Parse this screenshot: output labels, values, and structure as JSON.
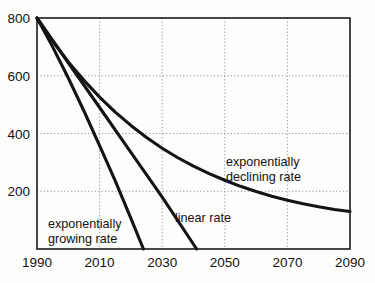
{
  "chart_data": {
    "type": "line",
    "title": "",
    "subtitle": "",
    "xlabel": "",
    "ylabel": "",
    "xlim": [
      1990,
      2090
    ],
    "ylim": [
      0,
      800
    ],
    "grid": true,
    "legend_position": "inline-annotations",
    "x_ticks": [
      1990,
      2010,
      2030,
      2050,
      2070,
      2090
    ],
    "x_tick_labels": [
      "1990",
      "2010",
      "2030",
      "2050",
      "2070",
      "2090"
    ],
    "y_ticks": [
      200,
      400,
      600,
      800
    ],
    "y_tick_labels": [
      "200",
      "400",
      "600",
      "800"
    ],
    "series": [
      {
        "name": "exponentially declining rate",
        "label": "exponentially declining rate",
        "label_line1": "exponentially",
        "label_line2": "declining rate",
        "x": [
          1990,
          1995,
          2000,
          2005,
          2010,
          2015,
          2020,
          2025,
          2030,
          2035,
          2040,
          2045,
          2050,
          2055,
          2060,
          2065,
          2070,
          2075,
          2080,
          2085,
          2090
        ],
        "values": [
          800,
          720,
          648,
          584,
          526,
          474,
          428,
          386,
          349,
          316,
          287,
          261,
          238,
          217,
          199,
          183,
          169,
          157,
          146,
          137,
          130
        ]
      },
      {
        "name": "linear rate",
        "label": "linear rate",
        "label_line1": "linear rate",
        "label_line2": "",
        "x": [
          1990,
          2000,
          2010,
          2020,
          2030,
          2041
        ],
        "values": [
          800,
          645,
          490,
          335,
          180,
          0
        ]
      },
      {
        "name": "exponentially growing rate",
        "label": "exponentially growing rate",
        "label_line1": "exponentially",
        "label_line2": "growing rate",
        "x": [
          1990,
          1995,
          2000,
          2005,
          2010,
          2015,
          2020,
          2024
        ],
        "values": [
          800,
          700,
          592,
          478,
          358,
          236,
          106,
          0
        ]
      }
    ],
    "annotations": [
      {
        "name": "exponentially-declining-rate-label",
        "line1": "exponentially",
        "line2": "declining rate",
        "x": 226,
        "y": 166
      },
      {
        "name": "linear-rate-label",
        "line1": "linear rate",
        "line2": "",
        "x": 175,
        "y": 222
      },
      {
        "name": "exponentially-growing-rate-label",
        "line1": "exponentially",
        "line2": "growing rate",
        "x": 48,
        "y": 228
      }
    ],
    "colors": {
      "curve": "#141414",
      "axis": "#1a1a1a",
      "grid": "#8a8a88",
      "background": "#fdfdfb",
      "text": "#121212"
    }
  }
}
